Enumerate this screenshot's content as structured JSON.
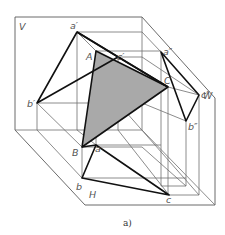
{
  "figure": {
    "caption": "a)",
    "planes": {
      "V": "V",
      "W": "W",
      "H": "H"
    },
    "points": {
      "A": "A",
      "B": "B",
      "C": "C",
      "a_prime": "a′",
      "b_prime": "b′",
      "c_prime": "c′",
      "a_dblprime": "a″",
      "b_dblprime": "b″",
      "c_dblprime": "c″",
      "a": "a",
      "b": "b",
      "c": "c"
    },
    "colors": {
      "triangle_fill": "#a9a9a9",
      "bold_line": "#111111",
      "thin_line": "#6f6f6f"
    }
  }
}
